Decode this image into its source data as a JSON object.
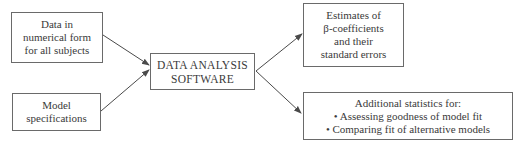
{
  "diagram": {
    "type": "flowchart",
    "nodes": {
      "input_data": {
        "lines": [
          "Data in",
          "numerical form",
          "for all subjects"
        ]
      },
      "input_model": {
        "lines": [
          "Model",
          "specifications"
        ]
      },
      "center": {
        "lines": [
          "DATA ANALYSIS",
          "SOFTWARE"
        ]
      },
      "output_estimates": {
        "lines": [
          "Estimates of",
          "β-coefficients",
          "and their",
          "standard errors"
        ]
      },
      "output_additional": {
        "lines": [
          "Additional statistics for:",
          "• Assessing goodness of model fit",
          "• Comparing fit of alternative models"
        ]
      }
    },
    "edges": [
      {
        "from": "input_data",
        "to": "center"
      },
      {
        "from": "input_model",
        "to": "center"
      },
      {
        "from": "center",
        "to": "output_estimates"
      },
      {
        "from": "center",
        "to": "output_additional"
      }
    ],
    "colors": {
      "border": "#6a6a6a",
      "arrow": "#4a4a4a",
      "text": "#3a3a3a",
      "background": "#ffffff"
    }
  }
}
